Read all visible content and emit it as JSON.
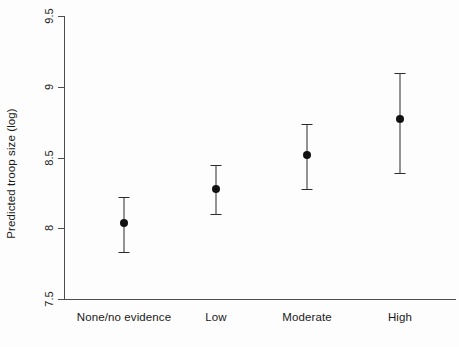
{
  "chart_data": {
    "type": "scatter",
    "title": "",
    "xlabel": "",
    "ylabel": "Predicted troop size (log)",
    "categories": [
      "None/no evidence",
      "Low",
      "Moderate",
      "High"
    ],
    "values": [
      8.04,
      8.28,
      8.52,
      8.77
    ],
    "error_low": [
      7.83,
      8.1,
      8.28,
      8.39
    ],
    "error_high": [
      8.22,
      8.45,
      8.74,
      9.1
    ],
    "ylim": [
      7.5,
      9.5
    ],
    "yticks": [
      7.5,
      8,
      8.5,
      9,
      9.5
    ],
    "ytick_labels": [
      "7.5",
      "8",
      "8.5",
      "9",
      "9.5"
    ],
    "grid": false,
    "legend": null,
    "marker": "filled-circle",
    "errorbar_style": "capped-vertical"
  },
  "axes": {
    "y_label": "Predicted troop size (log)",
    "y_ticks": [
      {
        "label": "9.5",
        "value": 9.5
      },
      {
        "label": "9",
        "value": 9
      },
      {
        "label": "8.5",
        "value": 8.5
      },
      {
        "label": "8",
        "value": 8
      },
      {
        "label": "7.5",
        "value": 7.5
      }
    ],
    "x_categories": [
      {
        "label": "None/no evidence"
      },
      {
        "label": "Low"
      },
      {
        "label": "Moderate"
      },
      {
        "label": "High"
      }
    ]
  },
  "colors": {
    "marker": "#111111",
    "errorbar": "#2b2b2b",
    "axis": "#4d4d4d",
    "text": "#1a1a1a",
    "background": "#fdfdfd"
  }
}
